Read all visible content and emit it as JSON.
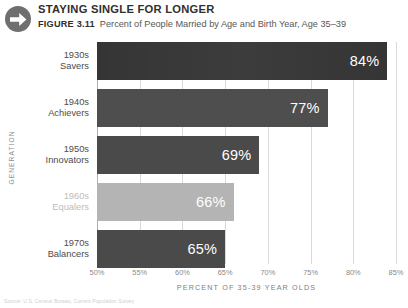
{
  "header": {
    "icon": "arrow-right-circle-icon",
    "kicker": "STAYING SINGLE FOR LONGER",
    "figure_number": "FIGURE 3.11",
    "figure_description": "Percent of People Married by Age and Birth Year, Age 35–39"
  },
  "source_note": "Source: U.S. Census Bureau, Current Population Survey",
  "chart_data": {
    "type": "bar",
    "orientation": "horizontal",
    "title": "STAYING SINGLE FOR LONGER",
    "subtitle": "Percent of People Married by Age and Birth Year, Age 35–39",
    "xlabel": "PERCENT OF 35-39 YEAR OLDS",
    "ylabel": "GENERATION",
    "categories": [
      "1930s Savers",
      "1940s Achievers",
      "1950s Innovators",
      "1960s Equalers",
      "1970s Balancers"
    ],
    "values": [
      84,
      77,
      69,
      66,
      65
    ],
    "value_labels": [
      "84%",
      "77%",
      "69%",
      "66%",
      "65%"
    ],
    "xlim": [
      50,
      85
    ],
    "xticks": [
      50,
      55,
      60,
      65,
      70,
      75,
      80,
      85
    ],
    "xtick_labels": [
      "50%",
      "55%",
      "60%",
      "65%",
      "70%",
      "75%",
      "80%",
      "85%"
    ],
    "grid": true,
    "legend": "none",
    "bars": [
      {
        "line1": "1930s",
        "line2": "Savers",
        "value": 84,
        "value_label": "84%",
        "color": "#353535",
        "highlighted": false
      },
      {
        "line1": "1940s",
        "line2": "Achievers",
        "value": 77,
        "value_label": "77%",
        "color": "#4e4e4e",
        "highlighted": false
      },
      {
        "line1": "1950s",
        "line2": "Innovators",
        "value": 69,
        "value_label": "69%",
        "color": "#4a4a4a",
        "highlighted": false
      },
      {
        "line1": "1960s",
        "line2": "Equalers",
        "value": 66,
        "value_label": "66%",
        "color": "#b4b4b4",
        "highlighted": true
      },
      {
        "line1": "1970s",
        "line2": "Balancers",
        "value": 65,
        "value_label": "65%",
        "color": "#4a4a4a",
        "highlighted": false
      }
    ],
    "colors": {
      "bar_dark": "#353535",
      "bar_mid": "#4e4e4e",
      "bar_light": "#b4b4b4",
      "gridline": "#d9d9d9",
      "axis_text": "#8a8a8a",
      "value_text": "#ffffff"
    }
  }
}
